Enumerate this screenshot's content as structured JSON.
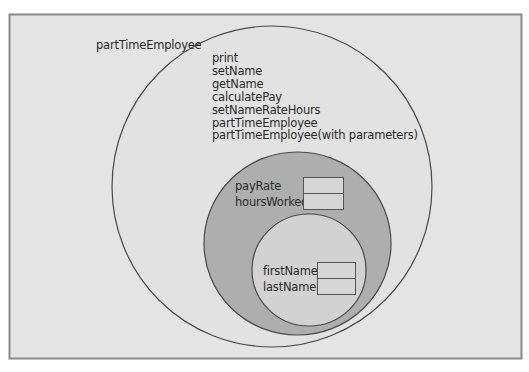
{
  "diagram": {
    "outer_label": "partTimeEmployee",
    "methods": [
      "print",
      "setName",
      "getName",
      "calculatePay",
      "setNameRateHours",
      "partTimeEmployee",
      "partTimeEmployee(with parameters)"
    ],
    "middle_layer": {
      "fields": [
        "payRate",
        "hoursWorked"
      ]
    },
    "inner_layer": {
      "fields": [
        "firstName",
        "lastName"
      ]
    },
    "colors": {
      "frame_fill": "#e4e4e4",
      "frame_border": "#8a8a8a",
      "outer_circle_fill": "#e2e2e2",
      "middle_circle_fill": "#aeaeae",
      "inner_circle_fill": "#d2d2d2",
      "outline": "#4a4a4a",
      "text": "#2a2a2a"
    }
  }
}
